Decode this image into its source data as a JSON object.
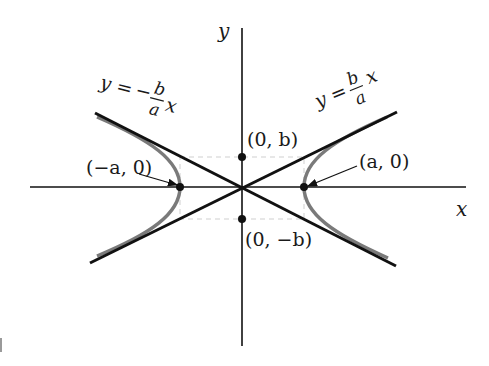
{
  "diagram": {
    "type": "hyperbola",
    "colors": {
      "axes": "#111111",
      "asymptotes": "#111111",
      "hyperbola": "#7a7a7a",
      "guide_rect": "#cfcfcf",
      "background": "#ffffff"
    },
    "axes": {
      "x_label": "x",
      "y_label": "y"
    },
    "asymptotes": {
      "negative": {
        "lhs": "y =",
        "sign": "−",
        "num": "b",
        "den": "a",
        "var": "x"
      },
      "positive": {
        "lhs": "y =",
        "num": "b",
        "den": "a",
        "var": "x"
      }
    },
    "points": {
      "left_vertex": "(−a, 0)",
      "right_vertex": "(a, 0)",
      "top_covertex": "(0, b)",
      "bottom_covertex": "(0, −b)"
    }
  }
}
